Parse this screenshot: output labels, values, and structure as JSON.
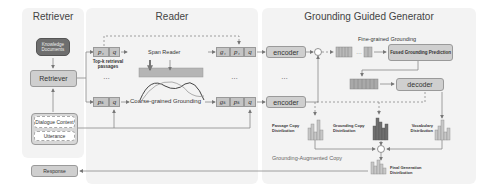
{
  "retriever": {
    "title": "Retriever",
    "knowledge_docs": "Knowledge Documents",
    "retriever_box": "Retriever",
    "dialogue_context": "Dialogue Context",
    "utterance": "Utterance",
    "response": "Response"
  },
  "reader": {
    "title": "Reader",
    "p1": "p₁",
    "pk": "pₖ",
    "q": "q",
    "top_k": "Top-k retrieval passages",
    "ellipsis": "…",
    "span_reader": "Span Reader",
    "coarse": "Coarse-grained Grounding",
    "g1": "g₁",
    "gk": "gₖ"
  },
  "generator": {
    "title": "Grounding Guided Generator",
    "encoder": "encoder",
    "ellipsis": "…",
    "fine_grained": "Fine-grained Grounding",
    "fused": "Fused Grounding Prediction",
    "decoder": "decoder",
    "passage_copy": "Passage Copy Distribution",
    "grounding_copy": "Grounding Copy Distribution",
    "vocab": "Vocabulary Distribution",
    "aug_copy": "Grounding-Augmented Copy",
    "final": "Final Generation Distribution",
    "plus": "+",
    "otimes": "⊗"
  }
}
